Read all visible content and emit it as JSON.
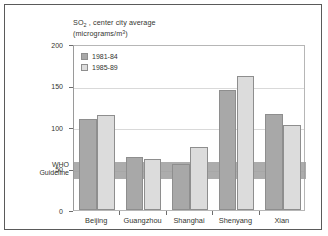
{
  "chart_data": {
    "type": "bar",
    "title": "SO2 , center city average",
    "title_main": "SO",
    "title_sub": "2",
    "title_rest": " , center city average",
    "subtitle": "(micrograms/m3)",
    "subtitle_main": "(micrograms/m",
    "subtitle_sup": "3",
    "subtitle_close": ")",
    "xlabel": "",
    "ylabel": "",
    "ylim": [
      0,
      200
    ],
    "yticks": [
      0,
      50,
      100,
      150,
      200
    ],
    "ytick_labels": [
      "0",
      "50",
      "100",
      "150",
      "200"
    ],
    "grid": true,
    "legend_position": "upper-left",
    "categories": [
      "Beijing",
      "Guangzhou",
      "Shanghai",
      "Shenyang",
      "Xian"
    ],
    "series": [
      {
        "name": "1981-84",
        "color": "#a8a8a8",
        "values": [
          110,
          64,
          55,
          144,
          116
        ]
      },
      {
        "name": "1985-89",
        "color": "#dcdcdc",
        "values": [
          115,
          62,
          76,
          161,
          103
        ]
      }
    ],
    "annotations": [
      {
        "name": "who-guideline-band",
        "label_line1": "WHO",
        "label_line2": "Guideline",
        "range": [
          40,
          60
        ],
        "color": "#9e9e9e"
      }
    ]
  },
  "axis": {
    "frame_color": "#5a5a5a",
    "grid_color": "#d9d9d9",
    "tick_color": "#6d6d6d",
    "text_color": "#33352f"
  }
}
